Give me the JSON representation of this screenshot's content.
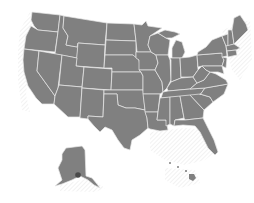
{
  "map": {
    "title": "United States map",
    "subject": "US states outline map",
    "fill_color": "#808080",
    "border_color": "#e8e8e8",
    "background_color": "#ffffff",
    "hatch_color": "#d8d8d8",
    "highlight_color": "#4a4a4a",
    "regions": [
      "Continental United States",
      "Alaska inset",
      "Hawaii inset"
    ],
    "highlight": "Alaska dark marker"
  }
}
